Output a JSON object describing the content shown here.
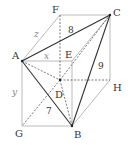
{
  "diagram": {
    "type": "3D box (rectangular prism) with tetrahedron ABCD inscribed",
    "vertices": {
      "A": {
        "label": "A",
        "x": 22,
        "y": 61
      },
      "B": {
        "label": "B",
        "x": 72,
        "y": 126
      },
      "C": {
        "label": "C",
        "x": 110,
        "y": 15
      },
      "D": {
        "label": "D",
        "x": 60,
        "y": 80
      },
      "E": {
        "label": "E",
        "x": 72,
        "y": 61
      },
      "F": {
        "label": "F",
        "x": 60,
        "y": 15
      },
      "G": {
        "label": "G",
        "x": 22,
        "y": 126
      },
      "H": {
        "label": "H",
        "x": 110,
        "y": 80
      }
    },
    "edge_labels": {
      "AC": "8",
      "BC": "9",
      "AB": "7",
      "AE": "x",
      "AG": "y",
      "AF": "z"
    },
    "colors": {
      "solid_edge": "#333333",
      "light_edge": "#aaaaaa",
      "dashed_edge": "#555555"
    }
  }
}
